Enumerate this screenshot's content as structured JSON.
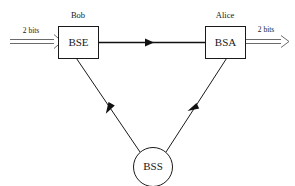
{
  "diagram": {
    "background_color": "#ffffff",
    "line_color": "#1a1a1a",
    "hollow_arrow_color": "#5a5a5a",
    "nodes": [
      {
        "id": "bse",
        "label": "BSE",
        "party": "Bob",
        "shape": "rectangle"
      },
      {
        "id": "bsa",
        "label": "BSA",
        "party": "Alice",
        "shape": "rectangle"
      },
      {
        "id": "bss",
        "label": "BSS",
        "shape": "circle"
      }
    ],
    "edges": [
      {
        "id": "input-edge",
        "label": "2 bits",
        "style": "hollow-double-line",
        "from": "external-input",
        "to": "bse"
      },
      {
        "id": "bse-to-bsa",
        "label": "",
        "style": "solid-line",
        "from": "bse",
        "to": "bsa"
      },
      {
        "id": "bss-to-bse",
        "label": "",
        "style": "solid-line",
        "from": "bss",
        "to": "bse"
      },
      {
        "id": "bss-to-bsa",
        "label": "",
        "style": "solid-line",
        "from": "bss",
        "to": "bsa"
      },
      {
        "id": "output-edge",
        "label": "2 bits",
        "style": "hollow-double-line",
        "from": "bsa",
        "to": "external-output"
      }
    ]
  }
}
